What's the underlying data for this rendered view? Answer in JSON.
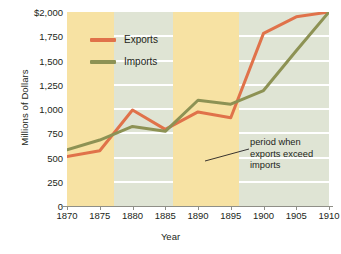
{
  "chart_data": {
    "type": "line",
    "title": "",
    "xlabel": "Year",
    "ylabel": "Millions of Dollars",
    "xlim": [
      1870,
      1910
    ],
    "ylim": [
      0,
      2000
    ],
    "grid": true,
    "legend_position": "top-left-inside",
    "x": [
      1870,
      1875,
      1880,
      1885,
      1890,
      1895,
      1900,
      1905,
      1910
    ],
    "xticks": [
      "1870",
      "1875",
      "1880",
      "1885",
      "1890",
      "1895",
      "1900",
      "1905",
      "1910"
    ],
    "yticks": [
      "$2,000",
      "1,750",
      "1,500",
      "1,250",
      "1,000",
      "750",
      "500",
      "250",
      "0"
    ],
    "ytick_values": [
      2000,
      1750,
      1500,
      1250,
      1000,
      750,
      500,
      250,
      0
    ],
    "series": [
      {
        "name": "Exports",
        "color": "#e0724a",
        "values": [
          510,
          570,
          990,
          790,
          970,
          910,
          1780,
          1950,
          2000
        ]
      },
      {
        "name": "Imports",
        "color": "#8d9254",
        "values": [
          580,
          680,
          820,
          770,
          1090,
          1050,
          1190,
          1600,
          2000
        ]
      }
    ],
    "shaded_bands": [
      {
        "label": "period when exports exceed imports",
        "start": 1870,
        "end": 1877.2
      },
      {
        "label": "period when exports exceed imports",
        "start": 1886.2,
        "end": 1896.3
      }
    ],
    "annotations": [
      {
        "text": "period when exports exceed imports",
        "lines": [
          "period when",
          "exports exceed",
          "imports"
        ]
      }
    ],
    "colors": {
      "plot_background": "#dfe4d4",
      "band": "#f7e2a3",
      "gridline": "#ffffff",
      "axis": "#8f8f87",
      "text": "#231f20",
      "exports": "#e0724a",
      "imports": "#8d9254"
    }
  }
}
